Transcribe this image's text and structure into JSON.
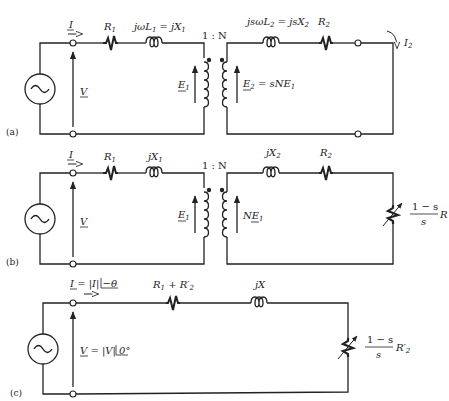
{
  "figure": {
    "type": "equivalent circuits of induction motor",
    "panels": [
      {
        "id": "a",
        "panel_label": "(a)",
        "current_in": "I",
        "voltage": "V",
        "r1": "R",
        "r1_sub": "1",
        "l1": "jωL",
        "l1_sub": "1",
        "l1_eq": " = jX",
        "l1_eq_sub": "1",
        "ratio": "1 : N",
        "e1": "E",
        "e1_sub": "1",
        "e2": "E",
        "e2_sub": "2",
        "e2_eq": " = sNE",
        "e2_eq_sub": "1",
        "l2": "jsωL",
        "l2_sub": "2",
        "l2_eq": " = jsX",
        "l2_eq_sub": "2",
        "r2": "R",
        "r2_sub": "2",
        "i2": "I",
        "i2_sub": "2"
      },
      {
        "id": "b",
        "panel_label": "(b)",
        "current_in": "I",
        "voltage": "V",
        "r1": "R",
        "r1_sub": "1",
        "x1": "jX",
        "x1_sub": "1",
        "ratio": "1 : N",
        "e1": "E",
        "e1_sub": "1",
        "ne1": "NE",
        "ne1_sub": "1",
        "x2": "jX",
        "x2_sub": "2",
        "r2": "R",
        "r2_sub": "2",
        "load_num": "1 − s",
        "load_den": "s",
        "load_r": "R"
      },
      {
        "id": "c",
        "panel_label": "(c)",
        "current_eq": "I = |I| ∠−θ",
        "current_sym": "I",
        "current_mag": " = |I| ",
        "current_ang": "−θ",
        "voltage_sym": "V",
        "voltage_mag": " = |V| ",
        "voltage_ang": "0°",
        "r_total": "R",
        "r_total_sub1": "1",
        "r_total_plus": " + R′",
        "r_total_sub2": "2",
        "x": "jX",
        "load_num": "1 − s",
        "load_den": "s",
        "load_r": "R′",
        "load_r_sub": "2"
      }
    ]
  },
  "icons": {
    "source": "ac-source-icon",
    "resistor": "resistor-icon",
    "inductor": "inductor-icon",
    "transformer": "transformer-icon",
    "variable_resistor": "variable-resistor-icon",
    "terminal": "terminal-circle-icon",
    "arrow": "arrow-icon"
  }
}
